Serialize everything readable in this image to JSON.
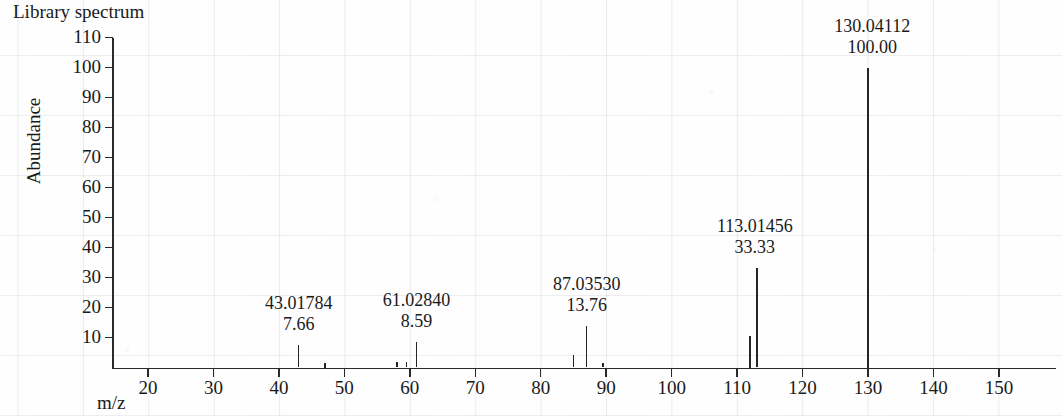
{
  "title": "Library spectrum",
  "axes": {
    "ylabel": "Abundance",
    "xlabel": "m/z",
    "yticks": [
      "110",
      "100",
      "90",
      "80",
      "70",
      "60",
      "50",
      "40",
      "30",
      "20",
      "10"
    ],
    "xticks": [
      "20",
      "30",
      "40",
      "50",
      "60",
      "70",
      "80",
      "90",
      "100",
      "110",
      "120",
      "130",
      "140",
      "150"
    ]
  },
  "colors": {
    "ink": "#242424",
    "axis": "#2a2a2a",
    "grid": "#8c919b",
    "paper": "#fefefe"
  },
  "chart_data": {
    "type": "bar",
    "title": "Library spectrum",
    "xlabel": "m/z",
    "ylabel": "Abundance",
    "xlim": [
      13,
      157
    ],
    "ylim": [
      0,
      112
    ],
    "grid": true,
    "legend": null,
    "yticks": [
      10,
      20,
      30,
      40,
      50,
      60,
      70,
      80,
      90,
      100,
      110
    ],
    "xticks": [
      20,
      30,
      40,
      50,
      60,
      70,
      80,
      90,
      100,
      110,
      120,
      130,
      140,
      150
    ],
    "labeled_peaks": [
      {
        "mz": 43.01784,
        "mz_text": "43.01784",
        "abundance": 7.66,
        "abundance_text": "7.66"
      },
      {
        "mz": 61.0284,
        "mz_text": "61.02840",
        "abundance": 8.59,
        "abundance_text": "8.59"
      },
      {
        "mz": 87.0353,
        "mz_text": "87.03530",
        "abundance": 13.76,
        "abundance_text": "13.76"
      },
      {
        "mz": 113.01456,
        "mz_text": "113.01456",
        "abundance": 33.33,
        "abundance_text": "33.33"
      },
      {
        "mz": 130.04112,
        "mz_text": "130.04112",
        "abundance": 100.0,
        "abundance_text": "100.00"
      }
    ],
    "peaks": [
      {
        "mz": 43.0,
        "abundance": 7.66,
        "labeled": true,
        "label_index": 0
      },
      {
        "mz": 47.0,
        "abundance": 1.5,
        "labeled": false
      },
      {
        "mz": 58.0,
        "abundance": 1.8,
        "labeled": false
      },
      {
        "mz": 59.5,
        "abundance": 1.8,
        "labeled": false
      },
      {
        "mz": 61.0,
        "abundance": 8.59,
        "labeled": true,
        "label_index": 1
      },
      {
        "mz": 85.0,
        "abundance": 4.2,
        "labeled": false
      },
      {
        "mz": 87.0,
        "abundance": 13.76,
        "labeled": true,
        "label_index": 2
      },
      {
        "mz": 89.5,
        "abundance": 1.6,
        "labeled": false
      },
      {
        "mz": 112.0,
        "abundance": 10.5,
        "labeled": false
      },
      {
        "mz": 113.0,
        "abundance": 33.33,
        "labeled": true,
        "label_index": 3
      },
      {
        "mz": 130.0,
        "abundance": 100.0,
        "labeled": true,
        "label_index": 4
      }
    ]
  }
}
